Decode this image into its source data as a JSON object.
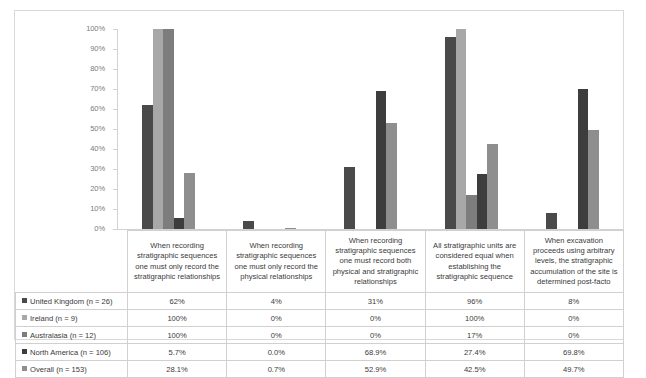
{
  "chart_data": {
    "type": "bar",
    "title": "",
    "xlabel": "",
    "ylabel": "",
    "ylim": [
      0,
      100
    ],
    "grid": false,
    "legend_position": "table-left-column",
    "ytick_labels": [
      "100%",
      "90%",
      "80%",
      "70%",
      "60%",
      "50%",
      "40%",
      "30%",
      "20%",
      "10%",
      "0%"
    ],
    "ytick_values": [
      100,
      90,
      80,
      70,
      60,
      50,
      40,
      30,
      20,
      10,
      0
    ],
    "categories": [
      "When recording stratigraphic sequences one must only record the stratigraphic relationships",
      "When recording stratigraphic sequences one must only record the physical relationships",
      "When recording stratigraphic sequences one must record both physical and stratigraphic relationships",
      "All stratigraphic units are considered equal when establishing the stratigraphic sequence",
      "When excavation proceeds using arbitrary levels, the stratigraphic accumulation of the site is determined post-facto"
    ],
    "series": [
      {
        "name": "United Kingdom (n = 26)",
        "color": "#4a4a4a",
        "values": [
          62,
          4,
          31,
          96,
          8
        ],
        "labels": [
          "62%",
          "4%",
          "31%",
          "96%",
          "8%"
        ]
      },
      {
        "name": "Ireland (n = 9)",
        "color": "#a8a8a8",
        "values": [
          100,
          0,
          0,
          100,
          0
        ],
        "labels": [
          "100%",
          "0%",
          "0%",
          "100%",
          "0%"
        ]
      },
      {
        "name": "Australasia (n = 12)",
        "color": "#7d7d7d",
        "values": [
          100,
          0,
          0,
          17,
          0
        ],
        "labels": [
          "100%",
          "0%",
          "0%",
          "17%",
          "0%"
        ]
      },
      {
        "name": "North America (n = 106)",
        "color": "#3d3d3d",
        "values": [
          5.7,
          0.0,
          68.9,
          27.4,
          69.8
        ],
        "labels": [
          "5.7%",
          "0.0%",
          "68.9%",
          "27.4%",
          "69.8%"
        ]
      },
      {
        "name": "Overall (n = 153)",
        "color": "#8e8e8e",
        "values": [
          28.1,
          0.7,
          52.9,
          42.5,
          49.7
        ],
        "labels": [
          "28.1%",
          "0.7%",
          "52.9%",
          "42.5%",
          "49.7%"
        ]
      }
    ]
  }
}
